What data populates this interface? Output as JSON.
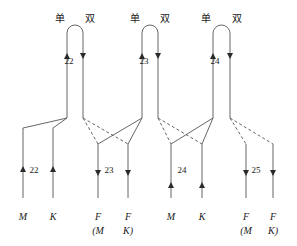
{
  "figure": {
    "title": "",
    "stroke_color": "#555555",
    "text_color": "#1a1a1a",
    "background": "#ffffff"
  },
  "top_labels": [
    {
      "text": "单",
      "x": 60,
      "y": 14
    },
    {
      "text": "双",
      "x": 90,
      "y": 14
    },
    {
      "text": "单",
      "x": 135,
      "y": 14
    },
    {
      "text": "双",
      "x": 165,
      "y": 14
    },
    {
      "text": "单",
      "x": 206,
      "y": 14
    },
    {
      "text": "双",
      "x": 237,
      "y": 14
    }
  ],
  "arch_numbers": [
    {
      "text": "22",
      "x": 69,
      "y": 57
    },
    {
      "text": "23",
      "x": 144,
      "y": 57
    },
    {
      "text": "24",
      "x": 215,
      "y": 57
    }
  ],
  "branch_numbers": [
    {
      "text": "22",
      "x": 34,
      "y": 166
    },
    {
      "text": "23",
      "x": 109,
      "y": 166
    },
    {
      "text": "24",
      "x": 182,
      "y": 166
    },
    {
      "text": "25",
      "x": 256,
      "y": 166
    }
  ],
  "terminals": [
    {
      "main": "M",
      "sub": "",
      "x": 23,
      "y": 212
    },
    {
      "main": "K",
      "sub": "",
      "x": 53,
      "y": 212
    },
    {
      "main": "F",
      "sub": "(M",
      "x": 98,
      "y": 212
    },
    {
      "main": "F",
      "sub": "K)",
      "x": 128,
      "y": 212
    },
    {
      "main": "M",
      "sub": "",
      "x": 171,
      "y": 212
    },
    {
      "main": "K",
      "sub": "",
      "x": 202,
      "y": 212
    },
    {
      "main": "F",
      "sub": "(M",
      "x": 246,
      "y": 212
    },
    {
      "main": "F",
      "sub": "K)",
      "x": 273,
      "y": 212
    }
  ],
  "arches": [
    {
      "left_x": 67,
      "right_x": 83,
      "top_y": 25,
      "bottom_y": 118,
      "left_arrow": "up",
      "right_arrow": "down"
    },
    {
      "left_x": 142,
      "right_x": 158,
      "top_y": 25,
      "bottom_y": 118,
      "left_arrow": "up",
      "right_arrow": "down"
    },
    {
      "left_x": 213,
      "right_x": 230,
      "top_y": 25,
      "bottom_y": 118,
      "left_arrow": "up",
      "right_arrow": "down"
    }
  ],
  "stems": [
    {
      "x": 23,
      "top_y": 128,
      "bottom_y": 198,
      "arrow": "up"
    },
    {
      "x": 53,
      "top_y": 128,
      "bottom_y": 198,
      "arrow": "up"
    },
    {
      "x": 98,
      "top_y": 144,
      "bottom_y": 198,
      "arrow": "down"
    },
    {
      "x": 128,
      "top_y": 144,
      "bottom_y": 198,
      "arrow": "down"
    },
    {
      "x": 171,
      "top_y": 144,
      "bottom_y": 198,
      "arrow": "up"
    },
    {
      "x": 202,
      "top_y": 144,
      "bottom_y": 198,
      "arrow": "up"
    },
    {
      "x": 246,
      "top_y": 144,
      "bottom_y": 198,
      "arrow": "down"
    },
    {
      "x": 273,
      "top_y": 144,
      "bottom_y": 198,
      "arrow": "down"
    }
  ],
  "connectors": [
    {
      "from_x": 67,
      "from_y": 118,
      "to_x": 23,
      "to_y": 128,
      "style": "solid"
    },
    {
      "from_x": 67,
      "from_y": 118,
      "to_x": 53,
      "to_y": 128,
      "style": "solid"
    },
    {
      "from_x": 83,
      "from_y": 118,
      "to_x": 98,
      "to_y": 144,
      "style": "dashed"
    },
    {
      "from_x": 83,
      "from_y": 118,
      "to_x": 128,
      "to_y": 144,
      "style": "dashed"
    },
    {
      "from_x": 142,
      "from_y": 118,
      "to_x": 98,
      "to_y": 144,
      "style": "solid"
    },
    {
      "from_x": 142,
      "from_y": 118,
      "to_x": 128,
      "to_y": 144,
      "style": "solid"
    },
    {
      "from_x": 158,
      "from_y": 118,
      "to_x": 171,
      "to_y": 144,
      "style": "dashed"
    },
    {
      "from_x": 158,
      "from_y": 118,
      "to_x": 202,
      "to_y": 144,
      "style": "dashed"
    },
    {
      "from_x": 213,
      "from_y": 118,
      "to_x": 171,
      "to_y": 144,
      "style": "solid"
    },
    {
      "from_x": 213,
      "from_y": 118,
      "to_x": 202,
      "to_y": 144,
      "style": "solid"
    },
    {
      "from_x": 230,
      "from_y": 118,
      "to_x": 246,
      "to_y": 144,
      "style": "dashed"
    },
    {
      "from_x": 230,
      "from_y": 118,
      "to_x": 273,
      "to_y": 144,
      "style": "dashed"
    }
  ]
}
